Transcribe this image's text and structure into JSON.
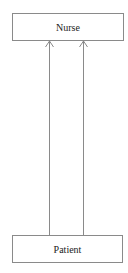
{
  "diagram": {
    "nodes": [
      {
        "id": "nurse",
        "label": "Nurse"
      },
      {
        "id": "patient",
        "label": "Patient"
      }
    ],
    "edges": [
      {
        "from": "patient",
        "to": "nurse",
        "arrow": "open"
      },
      {
        "from": "patient",
        "to": "nurse",
        "arrow": "open"
      }
    ],
    "colors": {
      "line": "#8a8a8a",
      "text": "#222222"
    }
  }
}
